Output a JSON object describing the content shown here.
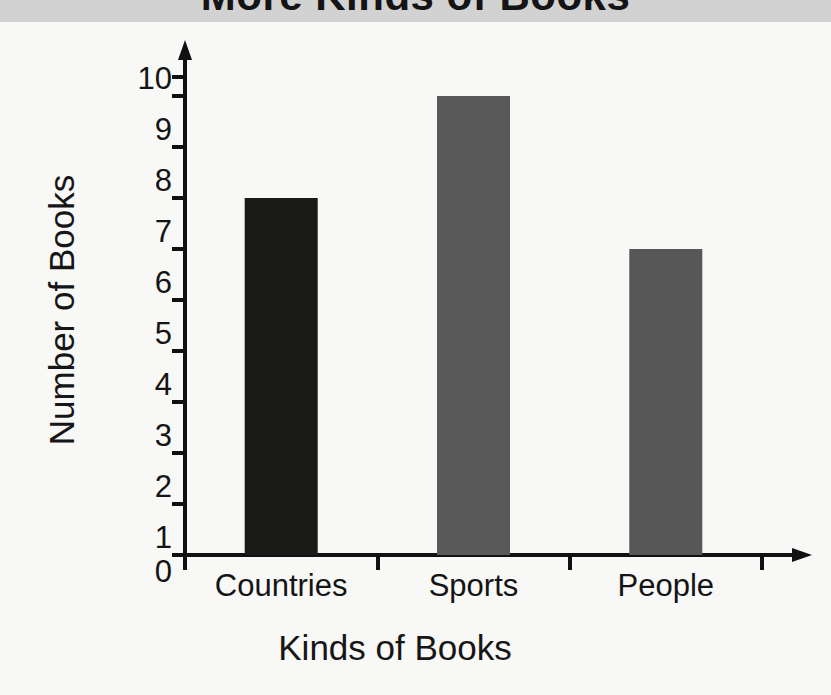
{
  "chart_data": {
    "type": "bar",
    "title": "More Kinds of Books",
    "xlabel": "Kinds of Books",
    "ylabel": "Number of Books",
    "categories": [
      "Countries",
      "Sports",
      "People"
    ],
    "values": [
      7,
      9,
      6
    ],
    "bar_colors": [
      "#1a1a18",
      "#595959",
      "#575757"
    ],
    "ylim": [
      0,
      10
    ],
    "yticks": [
      10,
      9,
      8,
      7,
      6,
      5,
      4,
      3,
      2,
      1,
      0
    ],
    "ytick_labels": [
      "10",
      "9",
      "8",
      "7",
      "6",
      "5",
      "4",
      "3",
      "2",
      "1",
      "0"
    ],
    "grid": false,
    "legend": false,
    "axis_style": "arrow-ended",
    "series": [
      {
        "name": "Number of Books",
        "values": [
          7,
          9,
          6
        ]
      }
    ]
  },
  "page": {
    "background_color": "#f8f8f6",
    "title_band_color": "#d2d2d2",
    "axis_color": "#111111"
  }
}
